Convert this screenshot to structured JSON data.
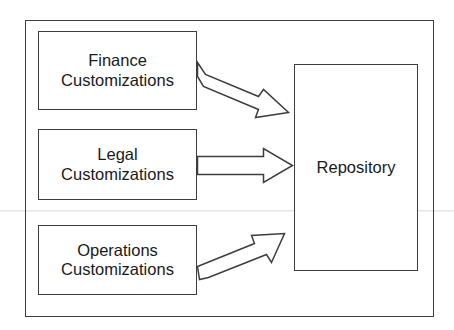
{
  "diagram": {
    "type": "block-flow-diagram",
    "frame": {
      "label": ""
    },
    "nodes": [
      {
        "id": "finance",
        "line1": "Finance",
        "line2": "Customizations",
        "shape": "rectangle"
      },
      {
        "id": "legal",
        "line1": "Legal",
        "line2": "Customizations",
        "shape": "rectangle"
      },
      {
        "id": "operations",
        "line1": "Operations",
        "line2": "Customizations",
        "shape": "rectangle"
      },
      {
        "id": "repository",
        "line1": "Repository",
        "line2": "",
        "shape": "rectangle"
      }
    ],
    "edges": [
      {
        "id": "finance-to-repository",
        "from": "finance",
        "to": "repository",
        "style": "hollow-block-arrow",
        "direction": "down-right",
        "label": ""
      },
      {
        "id": "legal-to-repository",
        "from": "legal",
        "to": "repository",
        "style": "hollow-block-arrow",
        "direction": "right",
        "label": ""
      },
      {
        "id": "operations-to-repository",
        "from": "operations",
        "to": "repository",
        "style": "hollow-block-arrow",
        "direction": "up-right",
        "label": ""
      }
    ],
    "colors": {
      "stroke": "#3d3d3d",
      "fill": "#ffffff",
      "text": "#1a1a1a",
      "background": "#ffffff"
    }
  }
}
